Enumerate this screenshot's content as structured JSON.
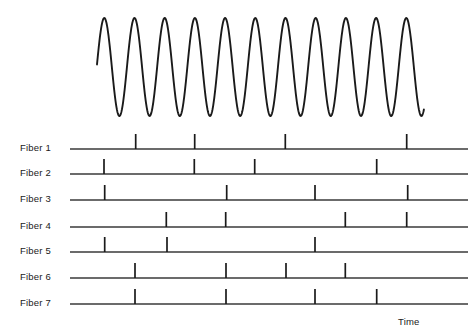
{
  "figure": {
    "background_color": "#ffffff",
    "trace_color": "#1a1a1a",
    "axis_color": "#3a3a3a",
    "time_axis_label": "Time"
  },
  "chart_data": {
    "type": "line",
    "title": "",
    "subtitle": "",
    "xlabel": "Time",
    "ylabel": "",
    "grid": false,
    "legend_position": "none",
    "xlim": [
      0,
      473
    ],
    "oscillation": {
      "name": "oscillation",
      "waveform": "sine",
      "x_start": 97,
      "x_end": 424,
      "peak_y": 18,
      "trough_y": 116,
      "midline_y": 67,
      "period_px": 30.2,
      "cycles": 11,
      "peak_x_positions": [
        104.3,
        134.5,
        164.7,
        194.9,
        225.1,
        255.3,
        285.5,
        315.7,
        345.9,
        376.1,
        406.3
      ],
      "start_phase_y": 49
    },
    "series": [
      {
        "name": "Fiber 1",
        "baseline_y": 149,
        "axis_x_start": 70,
        "axis_x_end": 468,
        "spike_height": 15,
        "spike_times": [
          135.7,
          194.7,
          285.3,
          406.7
        ]
      },
      {
        "name": "Fiber 2",
        "baseline_y": 174,
        "axis_x_start": 70,
        "axis_x_end": 468,
        "spike_height": 15,
        "spike_times": [
          104.0,
          194.3,
          254.7,
          376.7
        ]
      },
      {
        "name": "Fiber 3",
        "baseline_y": 200,
        "axis_x_start": 70,
        "axis_x_end": 468,
        "spike_height": 15,
        "spike_times": [
          104.7,
          226.7,
          315.0,
          407.7
        ]
      },
      {
        "name": "Fiber 4",
        "baseline_y": 227,
        "axis_x_start": 70,
        "axis_x_end": 468,
        "spike_height": 15,
        "spike_times": [
          166.3,
          225.7,
          345.3,
          406.7
        ]
      },
      {
        "name": "Fiber 5",
        "baseline_y": 252,
        "axis_x_start": 70,
        "axis_x_end": 468,
        "spike_height": 15,
        "spike_times": [
          104.7,
          167.0,
          315.0
        ]
      },
      {
        "name": "Fiber 6",
        "baseline_y": 278,
        "axis_x_start": 70,
        "axis_x_end": 468,
        "spike_height": 15,
        "spike_times": [
          135.0,
          226.0,
          286.0,
          345.3
        ]
      },
      {
        "name": "Fiber 7",
        "baseline_y": 304,
        "axis_x_start": 70,
        "axis_x_end": 468,
        "spike_height": 15,
        "spike_times": [
          135.0,
          226.0,
          315.0,
          376.7
        ]
      }
    ]
  },
  "labels": {
    "fibers": [
      {
        "text": "Fiber 1",
        "x": 20,
        "y": 142
      },
      {
        "text": "Fiber 2",
        "x": 20,
        "y": 167
      },
      {
        "text": "Fiber 3",
        "x": 20,
        "y": 193
      },
      {
        "text": "Fiber 4",
        "x": 20,
        "y": 220
      },
      {
        "text": "Fiber 5",
        "x": 20,
        "y": 245
      },
      {
        "text": "Fiber 6",
        "x": 20,
        "y": 271
      },
      {
        "text": "Fiber 7",
        "x": 20,
        "y": 297
      }
    ],
    "time": {
      "text": "Time",
      "x": 398,
      "y": 316
    }
  }
}
